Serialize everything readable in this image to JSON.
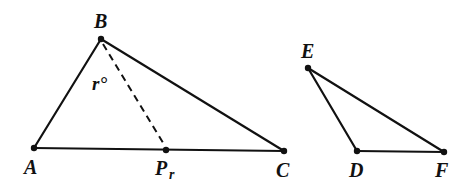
{
  "figure": {
    "triangles": [
      {
        "name": "ABC",
        "vertices": {
          "A": {
            "x": 34,
            "y": 148,
            "label": "A",
            "lx": 24,
            "ly": 174
          },
          "B": {
            "x": 101,
            "y": 39,
            "label": "B",
            "lx": 94,
            "ly": 28
          },
          "C": {
            "x": 284,
            "y": 151,
            "label": "C",
            "lx": 276,
            "ly": 177
          }
        }
      },
      {
        "name": "EDF",
        "vertices": {
          "E": {
            "x": 308,
            "y": 68,
            "label": "E",
            "lx": 301,
            "ly": 58
          },
          "D": {
            "x": 357,
            "y": 151,
            "label": "D",
            "lx": 349,
            "ly": 177
          },
          "F": {
            "x": 444,
            "y": 152,
            "label": "F",
            "lx": 435,
            "ly": 177
          }
        }
      }
    ],
    "point_P": {
      "x": 166,
      "y": 150,
      "label": "P",
      "subscript": "r",
      "lx": 155,
      "ly": 175
    },
    "segment_BP": {
      "style": "dashed"
    },
    "angle_label": {
      "text": "r°",
      "x": 92,
      "y": 90
    },
    "colors": {
      "ink": "#111111",
      "background": "#ffffff"
    }
  }
}
